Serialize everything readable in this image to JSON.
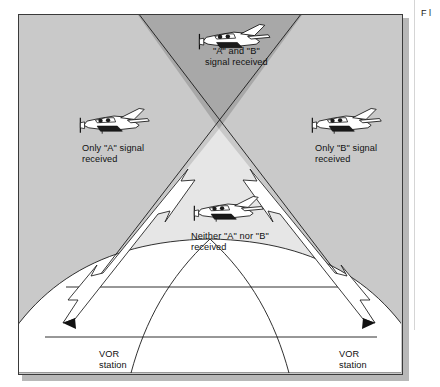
{
  "figure": {
    "kind": "vor-dual-station-reception-diagram",
    "background_color": "#c9c9c9",
    "overlap_cone_color": "#a8a8a8",
    "shadow_cone_color": "#e3e3e3",
    "earth_color": "#ffffff",
    "line_color": "#1a1a1a",
    "frame_border_color": "#3a3a3a"
  },
  "labels": {
    "both_signals": "\"A\" and \"B\"\nsignal received",
    "only_a": "Only \"A\" signal\nreceived",
    "only_b": "Only \"B\" signal\nreceived",
    "neither": "Neither \"A\" nor \"B\"\nreceived",
    "vor_station_a": "VOR\nstation\n\"A\"",
    "vor_station_b": "VOR\nstation\n\"B\""
  },
  "margin": {
    "clipped_text": "F\nl"
  },
  "aircraft": [
    {
      "name": "aircraft-both-signals",
      "x": 218,
      "y": 22
    },
    {
      "name": "aircraft-only-a",
      "x": 98,
      "y": 108
    },
    {
      "name": "aircraft-only-b",
      "x": 330,
      "y": 108
    },
    {
      "name": "aircraft-neither",
      "x": 212,
      "y": 196
    }
  ],
  "stations": [
    {
      "name": "vor-station-a-marker",
      "x": 62,
      "y": 322
    },
    {
      "name": "vor-station-b-marker",
      "x": 374,
      "y": 322
    }
  ]
}
